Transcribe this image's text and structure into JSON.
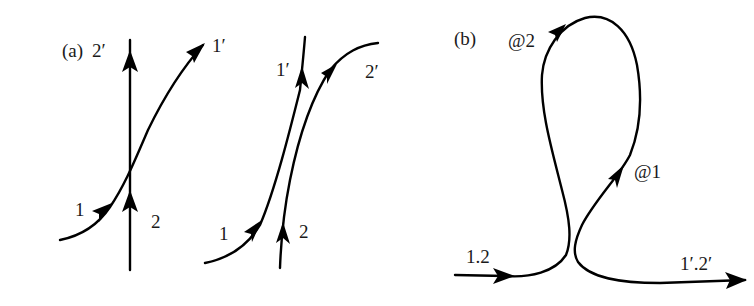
{
  "figure": {
    "panels": [
      {
        "id": "a",
        "label": "(a)",
        "subfigures": [
          {
            "name": "crossing",
            "labels": {
              "in_1": "1",
              "in_2": "2",
              "out_1": "1′",
              "out_2": "2′"
            }
          },
          {
            "name": "non-crossing",
            "labels": {
              "in_1": "1",
              "in_2": "2",
              "out_1": "1′",
              "out_2": "2′"
            }
          }
        ]
      },
      {
        "id": "b",
        "label": "(b)",
        "labels": {
          "input": "1.2",
          "output": "1′.2′",
          "point_1": "@1",
          "point_2": "@2"
        }
      }
    ],
    "colors": {
      "line": "#000000",
      "text": "#1a1a1a",
      "background": "#ffffff"
    }
  }
}
